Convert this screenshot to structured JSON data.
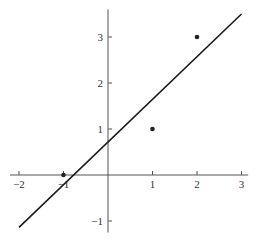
{
  "chart_data": {
    "type": "scatter",
    "title": "",
    "xlabel": "",
    "ylabel": "",
    "xlim": [
      -2.2,
      3.15
    ],
    "ylim": [
      -1.25,
      3.6
    ],
    "grid": false,
    "legend": null,
    "x_ticks": [
      -2,
      -1,
      1,
      2,
      3
    ],
    "x_tick_labels": [
      "−2",
      "−1",
      "1",
      "2",
      "3"
    ],
    "y_ticks": [
      -1,
      1,
      2,
      3
    ],
    "y_tick_labels": [
      "−1",
      "1",
      "2",
      "3"
    ],
    "series": [
      {
        "name": "data points",
        "kind": "scatter",
        "points": [
          {
            "x": -1,
            "y": 0
          },
          {
            "x": 1,
            "y": 1
          },
          {
            "x": 2,
            "y": 3
          }
        ],
        "color": "#222222"
      },
      {
        "name": "least-squares line",
        "kind": "line",
        "slope": 0.929,
        "intercept": 0.714,
        "x_range": [
          -2,
          3
        ],
        "points": [
          {
            "x": -2,
            "y": -1.14
          },
          {
            "x": 3,
            "y": 3.5
          }
        ],
        "color": "#222222"
      }
    ]
  },
  "layout": {
    "origin_px": [
      108,
      175
    ],
    "px_per_unit_x": 44.5,
    "px_per_unit_y": 46,
    "axis_color": "#555555",
    "line_color": "#1a1a1a"
  }
}
